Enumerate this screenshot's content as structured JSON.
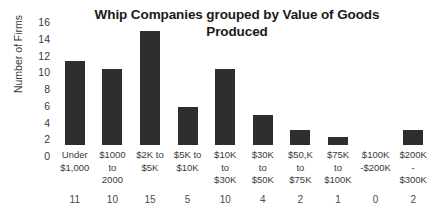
{
  "chart_data": {
    "type": "bar",
    "title": "Whip Companies grouped by Value of Goods Produced",
    "title_lines": [
      "Whip Companies grouped by Value of",
      "Goods Produced"
    ],
    "xlabel": "",
    "ylabel": "Number of Firms",
    "ylim": [
      0,
      16
    ],
    "ytick_step": 2,
    "yticks": [
      16,
      14,
      12,
      10,
      8,
      6,
      4,
      2,
      0
    ],
    "grid": false,
    "legend": "none",
    "bar_color": "#2e2e2e",
    "background_color": "#ffffff",
    "categories": [
      "Under $1,000",
      "$1000 to 2000",
      "$2K to $5K",
      "$5K to $10K",
      "$10K to $30K",
      "$30K to $50K",
      "$50,K to $75K",
      "$75K to $100K",
      "$100K -$200K",
      "$200K - $300K"
    ],
    "category_label_lines": [
      [
        "Under",
        "$1,000"
      ],
      [
        "$1000",
        "to",
        "2000"
      ],
      [
        "$2K to",
        "$5K"
      ],
      [
        "$5K to",
        "$10K"
      ],
      [
        "$10K",
        "to",
        "$30K"
      ],
      [
        "$30K",
        "to",
        "$50K"
      ],
      [
        "$50,K",
        "to",
        "$75K"
      ],
      [
        "$75K",
        "to",
        "$100K"
      ],
      [
        "$100K",
        "-$200K"
      ],
      [
        "$200K",
        "-",
        "$300K"
      ]
    ],
    "values": [
      11,
      10,
      15,
      5,
      10,
      4,
      2,
      1,
      0,
      2
    ],
    "value_row_labels": [
      "11",
      "10",
      "15",
      "5",
      "10",
      "4",
      "2",
      "1",
      "0",
      "2"
    ]
  }
}
